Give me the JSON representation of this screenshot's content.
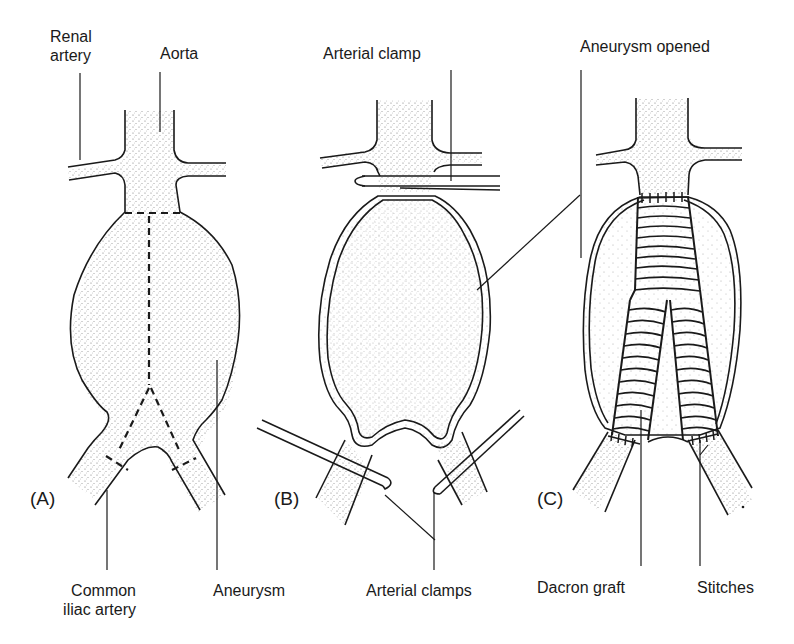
{
  "figure": {
    "panels": [
      {
        "id": "A",
        "label": "(A)",
        "annotations": [
          {
            "key": "renal_artery",
            "line1": "Renal",
            "line2": "artery"
          },
          {
            "key": "aorta",
            "text": "Aorta"
          },
          {
            "key": "common_iliac",
            "line1": "Common",
            "line2": "iliac artery"
          },
          {
            "key": "aneurysm",
            "text": "Aneurysm"
          }
        ]
      },
      {
        "id": "B",
        "label": "(B)",
        "annotations": [
          {
            "key": "arterial_clamp",
            "text": "Arterial clamp"
          },
          {
            "key": "arterial_clamps",
            "text": "Arterial clamps"
          }
        ]
      },
      {
        "id": "C",
        "label": "(C)",
        "annotations": [
          {
            "key": "aneurysm_opened",
            "text": "Aneurysm opened"
          },
          {
            "key": "dacron_graft",
            "text": "Dacron graft"
          },
          {
            "key": "stitches",
            "text": "Stitches"
          }
        ]
      }
    ],
    "colors": {
      "ink": "#1a1a1a",
      "stipple": "#8a8a8a",
      "background": "#ffffff"
    }
  }
}
